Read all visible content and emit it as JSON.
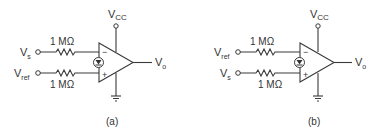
{
  "figure": {
    "panels": [
      {
        "id": "a",
        "caption": "(a)",
        "inputs": [
          {
            "label": "V",
            "sub": "s",
            "pin": "−",
            "resistor": "1 MΩ"
          },
          {
            "label": "V",
            "sub": "ref",
            "pin": "+",
            "resistor": "1 MΩ"
          }
        ],
        "supply": {
          "label": "V",
          "sub": "CC"
        },
        "output": {
          "label": "V",
          "sub": "o"
        }
      },
      {
        "id": "b",
        "caption": "(b)",
        "inputs": [
          {
            "label": "V",
            "sub": "ref",
            "pin": "−",
            "resistor": "1 MΩ"
          },
          {
            "label": "V",
            "sub": "s",
            "pin": "+",
            "resistor": "1 MΩ"
          }
        ],
        "supply": {
          "label": "V",
          "sub": "CC"
        },
        "output": {
          "label": "V",
          "sub": "o"
        }
      }
    ],
    "colors": {
      "line": "#3a3a3a",
      "text": "#333333"
    }
  }
}
